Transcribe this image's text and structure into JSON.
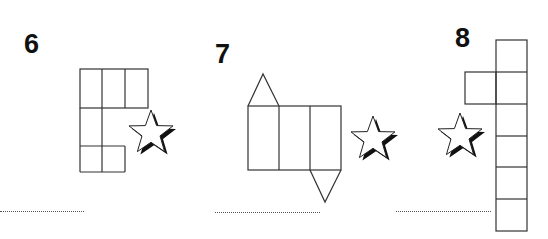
{
  "exercises": [
    {
      "number": "6",
      "shape": "net-of-cuboid-grid",
      "star_icon": "star-icon",
      "answer_line": ""
    },
    {
      "number": "7",
      "shape": "net-of-triangular-prism",
      "star_icon": "star-icon",
      "answer_line": ""
    },
    {
      "number": "8",
      "shape": "net-of-cuboid-column",
      "star_icon": "star-icon",
      "answer_line": ""
    }
  ],
  "colors": {
    "line": "#333333",
    "shadow": "#111111",
    "background": "#ffffff"
  }
}
